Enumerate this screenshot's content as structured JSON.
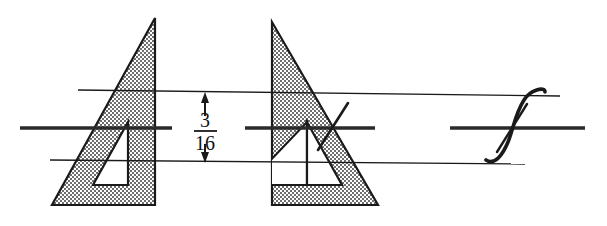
{
  "figure": {
    "background_color": "#ffffff",
    "ink_color": "#1a1a1a",
    "shading_color": "#9a9a9a",
    "width": 607,
    "height": 226
  },
  "dimension": {
    "name": "vertical-line-spacing",
    "numerator": "3",
    "denominator": "16",
    "display": "3/16",
    "unit": "inch",
    "arrow_top_y": 96,
    "arrow_bottom_y": 160
  },
  "guide_lines": {
    "top_label": "upper horizontal guide line",
    "middle_label": "middle horizontal center line",
    "bottom_label": "lower horizontal guide line",
    "top_y": 92,
    "middle_y": 128,
    "bottom_y": 162
  },
  "triangles": [
    {
      "name": "triangle-left",
      "orientation": "right-angle-bottom-right",
      "apex": "top-right",
      "cutout": "inner-triangle-apex-top-right"
    },
    {
      "name": "triangle-right",
      "orientation": "right-angle-bottom-left",
      "apex": "top-left",
      "cutout": "inner-triangle-apex-top-left"
    }
  ],
  "strokes": [
    {
      "name": "short-diagonal-stroke",
      "description": "short straight pencil stroke crossing the second triangle hypotenuse"
    },
    {
      "name": "s-curve-stroke",
      "description": "freehand S shaped curve between the upper and lower guide lines"
    },
    {
      "name": "crossing-diagonal-stroke",
      "description": "straight diagonal crossing the S curve at the center line"
    }
  ]
}
